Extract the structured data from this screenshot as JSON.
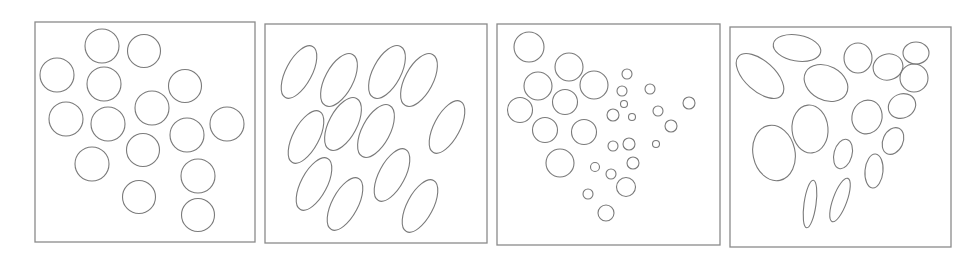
{
  "figure": {
    "width": 979,
    "height": 262,
    "stroke_color": "#7a7a7a",
    "frame_color": "#8a8a8a",
    "background": "#ffffff",
    "panels": [
      {
        "id": "panel-1-uniform-circles",
        "frame": {
          "x": 35,
          "y": 22,
          "w": 220,
          "h": 220
        },
        "shapes": [
          {
            "cx": 102,
            "cy": 46,
            "rx": 17,
            "ry": 17,
            "rot": 0
          },
          {
            "cx": 144,
            "cy": 51,
            "rx": 16.5,
            "ry": 16.5,
            "rot": 0
          },
          {
            "cx": 57,
            "cy": 75,
            "rx": 17,
            "ry": 17,
            "rot": 0
          },
          {
            "cx": 104,
            "cy": 84,
            "rx": 17,
            "ry": 17,
            "rot": 0
          },
          {
            "cx": 185,
            "cy": 86,
            "rx": 16.5,
            "ry": 16.5,
            "rot": 0
          },
          {
            "cx": 66,
            "cy": 119,
            "rx": 17,
            "ry": 17,
            "rot": 0
          },
          {
            "cx": 108,
            "cy": 124,
            "rx": 17,
            "ry": 17,
            "rot": 0
          },
          {
            "cx": 152,
            "cy": 108,
            "rx": 17,
            "ry": 17,
            "rot": 0
          },
          {
            "cx": 187,
            "cy": 135,
            "rx": 17,
            "ry": 17,
            "rot": 0
          },
          {
            "cx": 227,
            "cy": 124,
            "rx": 17,
            "ry": 17,
            "rot": 0
          },
          {
            "cx": 143,
            "cy": 150,
            "rx": 16.5,
            "ry": 16.5,
            "rot": 0
          },
          {
            "cx": 92,
            "cy": 164,
            "rx": 17,
            "ry": 17,
            "rot": 0
          },
          {
            "cx": 198,
            "cy": 176,
            "rx": 17,
            "ry": 17,
            "rot": 0
          },
          {
            "cx": 139,
            "cy": 197,
            "rx": 16.5,
            "ry": 16.5,
            "rot": 0
          },
          {
            "cx": 198,
            "cy": 215,
            "rx": 16.5,
            "ry": 16.5,
            "rot": 0
          }
        ]
      },
      {
        "id": "panel-2-oriented-ellipses",
        "frame": {
          "x": 265,
          "y": 24,
          "w": 222,
          "h": 219
        },
        "shapes": [
          {
            "cx": 299,
            "cy": 72,
            "rx": 29,
            "ry": 13,
            "rot": -62
          },
          {
            "cx": 339,
            "cy": 80,
            "rx": 29,
            "ry": 14,
            "rot": -62
          },
          {
            "cx": 387,
            "cy": 72,
            "rx": 29,
            "ry": 14,
            "rot": -62
          },
          {
            "cx": 419,
            "cy": 80,
            "rx": 29,
            "ry": 14,
            "rot": -62
          },
          {
            "cx": 306,
            "cy": 137,
            "rx": 29,
            "ry": 13,
            "rot": -62
          },
          {
            "cx": 343,
            "cy": 124,
            "rx": 29,
            "ry": 14,
            "rot": -62
          },
          {
            "cx": 376,
            "cy": 131,
            "rx": 29,
            "ry": 14,
            "rot": -62
          },
          {
            "cx": 447,
            "cy": 127,
            "rx": 29,
            "ry": 13,
            "rot": -62
          },
          {
            "cx": 314,
            "cy": 184,
            "rx": 29,
            "ry": 13,
            "rot": -62
          },
          {
            "cx": 345,
            "cy": 204,
            "rx": 29,
            "ry": 13,
            "rot": -62
          },
          {
            "cx": 392,
            "cy": 175,
            "rx": 29,
            "ry": 13,
            "rot": -62
          },
          {
            "cx": 420,
            "cy": 206,
            "rx": 29,
            "ry": 13,
            "rot": -62
          }
        ]
      },
      {
        "id": "panel-3-mixed-size-circles",
        "frame": {
          "x": 497,
          "y": 24,
          "w": 223,
          "h": 221
        },
        "shapes": [
          {
            "cx": 529,
            "cy": 47,
            "rx": 15,
            "ry": 15,
            "rot": 0
          },
          {
            "cx": 569,
            "cy": 67,
            "rx": 14,
            "ry": 14,
            "rot": 0
          },
          {
            "cx": 538,
            "cy": 86,
            "rx": 14,
            "ry": 14,
            "rot": 0
          },
          {
            "cx": 594,
            "cy": 85,
            "rx": 14,
            "ry": 14,
            "rot": 0
          },
          {
            "cx": 565,
            "cy": 102,
            "rx": 12.5,
            "ry": 12.5,
            "rot": 0
          },
          {
            "cx": 520,
            "cy": 110,
            "rx": 12.5,
            "ry": 12.5,
            "rot": 0
          },
          {
            "cx": 545,
            "cy": 130,
            "rx": 12.5,
            "ry": 12.5,
            "rot": 0
          },
          {
            "cx": 584,
            "cy": 132,
            "rx": 12.5,
            "ry": 12.5,
            "rot": 0
          },
          {
            "cx": 560,
            "cy": 163,
            "rx": 14,
            "ry": 14,
            "rot": 0
          },
          {
            "cx": 627,
            "cy": 74,
            "rx": 5,
            "ry": 5,
            "rot": 0
          },
          {
            "cx": 622,
            "cy": 91,
            "rx": 5,
            "ry": 5,
            "rot": 0
          },
          {
            "cx": 650,
            "cy": 89,
            "rx": 5,
            "ry": 5,
            "rot": 0
          },
          {
            "cx": 624,
            "cy": 104,
            "rx": 3.5,
            "ry": 3.5,
            "rot": 0
          },
          {
            "cx": 613,
            "cy": 115,
            "rx": 6,
            "ry": 6,
            "rot": 0
          },
          {
            "cx": 632,
            "cy": 117,
            "rx": 3.5,
            "ry": 3.5,
            "rot": 0
          },
          {
            "cx": 658,
            "cy": 111,
            "rx": 5,
            "ry": 5,
            "rot": 0
          },
          {
            "cx": 689,
            "cy": 103,
            "rx": 6,
            "ry": 6,
            "rot": 0
          },
          {
            "cx": 671,
            "cy": 126,
            "rx": 6,
            "ry": 6,
            "rot": 0
          },
          {
            "cx": 613,
            "cy": 146,
            "rx": 5,
            "ry": 5,
            "rot": 0
          },
          {
            "cx": 629,
            "cy": 144,
            "rx": 6,
            "ry": 6,
            "rot": 0
          },
          {
            "cx": 656,
            "cy": 144,
            "rx": 3.5,
            "ry": 3.5,
            "rot": 0
          },
          {
            "cx": 633,
            "cy": 163,
            "rx": 6,
            "ry": 6,
            "rot": 0
          },
          {
            "cx": 595,
            "cy": 167,
            "rx": 4.5,
            "ry": 4.5,
            "rot": 0
          },
          {
            "cx": 611,
            "cy": 174,
            "rx": 5,
            "ry": 5,
            "rot": 0
          },
          {
            "cx": 626,
            "cy": 187,
            "rx": 9.5,
            "ry": 9.5,
            "rot": 0
          },
          {
            "cx": 588,
            "cy": 194,
            "rx": 5,
            "ry": 5,
            "rot": 0
          },
          {
            "cx": 606,
            "cy": 213,
            "rx": 8,
            "ry": 8,
            "rot": 0
          }
        ]
      },
      {
        "id": "panel-4-mixed-ellipses",
        "frame": {
          "x": 730,
          "y": 27,
          "w": 221,
          "h": 220
        },
        "shapes": [
          {
            "cx": 797,
            "cy": 48,
            "rx": 24,
            "ry": 13,
            "rot": 10
          },
          {
            "cx": 760,
            "cy": 76,
            "rx": 29,
            "ry": 15,
            "rot": 42
          },
          {
            "cx": 826,
            "cy": 83,
            "rx": 23,
            "ry": 17,
            "rot": 28
          },
          {
            "cx": 858,
            "cy": 58,
            "rx": 14,
            "ry": 15,
            "rot": 0
          },
          {
            "cx": 888,
            "cy": 67,
            "rx": 15,
            "ry": 13,
            "rot": -15
          },
          {
            "cx": 916,
            "cy": 53,
            "rx": 13,
            "ry": 11,
            "rot": 0
          },
          {
            "cx": 914,
            "cy": 78,
            "rx": 14,
            "ry": 14,
            "rot": 0
          },
          {
            "cx": 810,
            "cy": 129,
            "rx": 18,
            "ry": 24,
            "rot": -5
          },
          {
            "cx": 774,
            "cy": 153,
            "rx": 21,
            "ry": 28,
            "rot": -12
          },
          {
            "cx": 867,
            "cy": 117,
            "rx": 15,
            "ry": 17,
            "rot": 15
          },
          {
            "cx": 902,
            "cy": 106,
            "rx": 14,
            "ry": 12,
            "rot": -25
          },
          {
            "cx": 893,
            "cy": 141,
            "rx": 10,
            "ry": 14,
            "rot": 25
          },
          {
            "cx": 843,
            "cy": 154,
            "rx": 9,
            "ry": 15,
            "rot": 15
          },
          {
            "cx": 874,
            "cy": 171,
            "rx": 9,
            "ry": 17,
            "rot": 5
          },
          {
            "cx": 810,
            "cy": 204,
            "rx": 6,
            "ry": 24,
            "rot": 8
          },
          {
            "cx": 840,
            "cy": 200,
            "rx": 7,
            "ry": 23,
            "rot": 20
          }
        ]
      }
    ]
  }
}
